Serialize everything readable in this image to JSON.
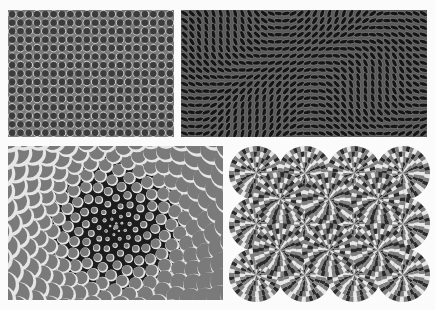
{
  "background": "#fbfbfb",
  "panels": [
    {
      "id": "dot-grid",
      "label": "Gray grid of dark circles with light edges",
      "x": 8,
      "y": 10,
      "w": 166,
      "h": 127,
      "bg": "#7b7b7b",
      "dot": "#3c3c3c",
      "rim": "#d8d8d8",
      "cols": 20,
      "rows": 15
    },
    {
      "id": "wavy-blobs",
      "label": "Dark panel of tilted elliptical blobs forming waves",
      "x": 181,
      "y": 10,
      "w": 246,
      "h": 127,
      "bg": "#5a5a5a",
      "blob": "#151515",
      "line": "#9a9a9a",
      "cols": 34,
      "rows": 18
    },
    {
      "id": "spiral-circles",
      "label": "Spiral of gray circles with white rims on black",
      "x": 8,
      "y": 146,
      "w": 215,
      "h": 154,
      "bg": "#1c1c1c",
      "disc": "#7a7a7a",
      "rim": "#e6e6e6",
      "cx": 108,
      "cy": 81
    },
    {
      "id": "rotating-snakes",
      "label": "Rotating snakes rosettes",
      "x": 228,
      "y": 145,
      "w": 202,
      "h": 158,
      "bg": "#fbfbfb",
      "dark": "#2a2a2a",
      "mid": "#808080",
      "light": "#e8e8e8",
      "cols": 4,
      "rows": 3
    }
  ]
}
